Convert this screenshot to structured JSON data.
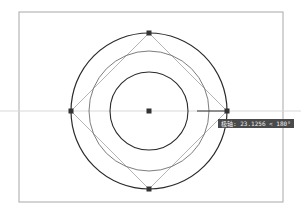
{
  "viewport": {
    "frame": {
      "x": 19,
      "y": 12,
      "width": 264,
      "height": 190,
      "color": "#a8a8a8"
    }
  },
  "drawing": {
    "center": {
      "x": 149,
      "y": 111
    },
    "circles": [
      {
        "name": "outer-circle",
        "r": 78,
        "color": "#2a2a2a",
        "width": 1.2
      },
      {
        "name": "middle-circle",
        "r": 60,
        "color": "#6e6e6e",
        "width": 0.9
      },
      {
        "name": "inner-circle",
        "r": 39,
        "color": "#2a2a2a",
        "width": 1.1
      }
    ],
    "polygon": {
      "name": "diamond-square",
      "color": "#b4b4b4",
      "width": 1
    },
    "grips": [
      "top",
      "right",
      "bottom",
      "left",
      "center"
    ],
    "grip_color": "#333333",
    "tracking_line_color": "#d8d8d8",
    "cursor_line_color": "#333333"
  },
  "tooltip": {
    "text": "极轴: 23.1256 < 180°"
  }
}
